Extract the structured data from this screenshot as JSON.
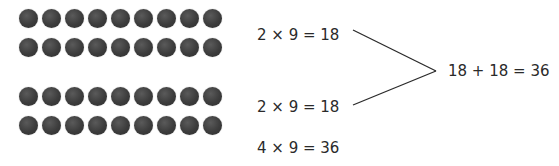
{
  "dot_groups": [
    {
      "rows": 2,
      "cols": 9,
      "top_row_y": 18,
      "label": "2 × 9 = 18"
    },
    {
      "rows": 2,
      "cols": 9,
      "top_row_y": 96,
      "label": "2 × 9 = 18"
    }
  ],
  "equations": {
    "group1": "2 × 9 = 18",
    "group2": "2 × 9 = 18",
    "total": "4 × 9 = 36",
    "sum": "18 + 18 = 36"
  },
  "colors": {
    "dot": "#3c3c3c",
    "text": "#2a2a2a",
    "line": "#2a2a2a"
  }
}
